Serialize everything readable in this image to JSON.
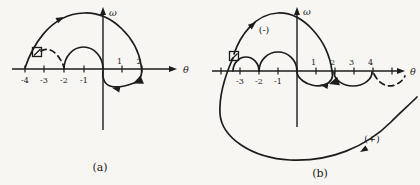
{
  "figure": {
    "background_color": "#f7f6f3",
    "ink_color": "#1c1c1c",
    "panel_a": {
      "caption": "(a)",
      "omega_label": "ω",
      "theta_label": "θ",
      "ticks_negative": [
        "-4",
        "-3",
        "-2",
        "-1"
      ],
      "ticks_positive": [
        "1",
        "2"
      ],
      "markers": {
        "square_marker": "open-square-with-diagonal",
        "triangle_marker": "filled-triangle-direction-marker"
      }
    },
    "panel_b": {
      "caption": "(b)",
      "omega_label": "ω",
      "theta_label": "θ",
      "ticks_negative": [
        "-3",
        "-2",
        "-1"
      ],
      "ticks_positive": [
        "1",
        "2",
        "3",
        "4"
      ],
      "neg_branch_label": "(-)",
      "pos_branch_label": "(+)",
      "markers": {
        "square_marker": "open-square-with-diagonal",
        "triangle_marker": "filled-triangle-direction-marker"
      }
    }
  }
}
